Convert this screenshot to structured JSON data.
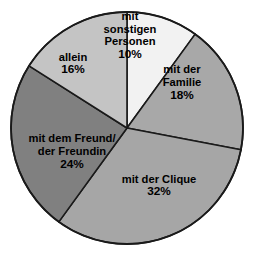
{
  "chart_data": {
    "type": "pie",
    "title": "",
    "subtitle": "",
    "xlabel": "",
    "ylabel": "",
    "legend_position": "none",
    "grid": false,
    "start_angle_deg": 0,
    "direction": "clockwise",
    "units": "%",
    "categories": [
      "mit sonstigen Personen",
      "mit der Familie",
      "mit der Clique",
      "mit dem Freund/der Freundin",
      "allein"
    ],
    "values": [
      10,
      18,
      32,
      24,
      16
    ],
    "slices": [
      {
        "key": "sonstige-personen",
        "label_lines": [
          "mit",
          "sonstigen",
          "Personen"
        ],
        "value": 10,
        "value_text": "10%",
        "color": "#f2f2f2",
        "label_x": 130,
        "label_y": 36
      },
      {
        "key": "familie",
        "label_lines": [
          "mit der",
          "Familie"
        ],
        "value": 18,
        "value_text": "18%",
        "color": "#a8a8a8",
        "label_x": 182,
        "label_y": 83
      },
      {
        "key": "clique",
        "label_lines": [
          "mit der Clique"
        ],
        "value": 32,
        "value_text": "32%",
        "color": "#a6a6a6",
        "label_x": 159,
        "label_y": 186
      },
      {
        "key": "freund-freundin",
        "label_lines": [
          "mit dem Freund/",
          "der Freundin"
        ],
        "value": 24,
        "value_text": "24%",
        "color": "#808080",
        "label_x": 72,
        "label_y": 152
      },
      {
        "key": "allein",
        "label_lines": [
          "allein"
        ],
        "value": 16,
        "value_text": "16%",
        "color": "#c4c4c4",
        "label_x": 73,
        "label_y": 64
      }
    ],
    "geometry": {
      "center_x": 127,
      "center_y": 128,
      "radius": 116
    },
    "colors": {
      "background": "#ffffff",
      "outline": "#1a1a1a",
      "label_text": "#000000"
    }
  }
}
